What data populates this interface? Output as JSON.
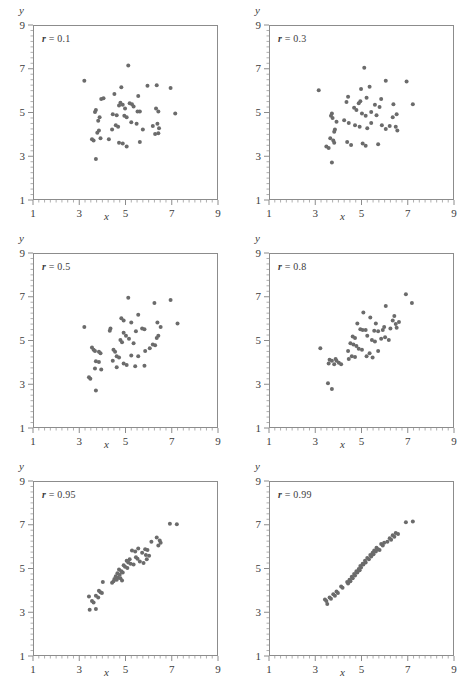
{
  "figure": {
    "type": "scatter-grid",
    "rows": 3,
    "cols": 2,
    "dot_color": "#6b6b6b",
    "frame_color": "#8c8c8c",
    "text_color": "#3c3c3c",
    "background": "#ffffff"
  },
  "axes_common": {
    "xlabel": "x",
    "ylabel": "y",
    "xlim": [
      1,
      9
    ],
    "ylim": [
      1,
      9
    ],
    "xticks": [
      1,
      3,
      5,
      7,
      9
    ],
    "yticks": [
      1,
      3,
      5,
      7,
      9
    ],
    "xtick_labels": [
      "1",
      "3",
      "5",
      "7",
      "9"
    ],
    "ytick_labels": [
      "1",
      "3",
      "5",
      "7",
      "9"
    ],
    "minor_ticks": true,
    "grid": false,
    "legend": "none"
  },
  "chart_data": [
    {
      "type": "scatter",
      "title": "",
      "annotation": "r = 0.1",
      "r_symbol": "r",
      "r_equals": " = ",
      "r_value": "0.1",
      "xlabel": "x",
      "ylabel": "y",
      "xlim": [
        1,
        9
      ],
      "ylim": [
        1,
        9
      ],
      "n": 52,
      "points": [
        [
          3.22,
          6.45
        ],
        [
          5.12,
          7.15
        ],
        [
          4.82,
          6.15
        ],
        [
          5.95,
          6.22
        ],
        [
          6.35,
          6.25
        ],
        [
          6.95,
          6.12
        ],
        [
          4.52,
          5.85
        ],
        [
          5.55,
          5.75
        ],
        [
          4.05,
          5.65
        ],
        [
          3.95,
          5.62
        ],
        [
          4.78,
          5.45
        ],
        [
          4.88,
          5.35
        ],
        [
          4.72,
          5.32
        ],
        [
          5.28,
          5.38
        ],
        [
          5.52,
          5.05
        ],
        [
          5.62,
          5.05
        ],
        [
          6.32,
          5.18
        ],
        [
          6.42,
          5.05
        ],
        [
          3.72,
          5.12
        ],
        [
          3.68,
          5.02
        ],
        [
          4.45,
          4.92
        ],
        [
          4.62,
          4.88
        ],
        [
          7.15,
          4.95
        ],
        [
          3.88,
          4.78
        ],
        [
          3.82,
          4.62
        ],
        [
          4.95,
          4.85
        ],
        [
          5.05,
          4.78
        ],
        [
          5.25,
          4.55
        ],
        [
          4.68,
          4.35
        ],
        [
          4.58,
          4.42
        ],
        [
          5.48,
          4.48
        ],
        [
          6.18,
          4.38
        ],
        [
          6.38,
          4.48
        ],
        [
          6.45,
          4.28
        ],
        [
          3.85,
          4.18
        ],
        [
          3.78,
          4.08
        ],
        [
          4.42,
          4.22
        ],
        [
          5.75,
          4.22
        ],
        [
          6.28,
          4.02
        ],
        [
          6.42,
          4.05
        ],
        [
          3.55,
          3.78
        ],
        [
          3.62,
          3.72
        ],
        [
          3.92,
          3.82
        ],
        [
          4.28,
          3.78
        ],
        [
          4.72,
          3.62
        ],
        [
          5.05,
          3.45
        ],
        [
          5.62,
          3.65
        ],
        [
          4.88,
          3.58
        ],
        [
          3.72,
          2.88
        ],
        [
          5.35,
          5.28
        ],
        [
          5.18,
          5.42
        ],
        [
          4.98,
          5.18
        ]
      ]
    },
    {
      "type": "scatter",
      "title": "",
      "annotation": "r = 0.3",
      "r_symbol": "r",
      "r_equals": " = ",
      "r_value": "0.3",
      "xlabel": "x",
      "ylabel": "y",
      "xlim": [
        1,
        9
      ],
      "ylim": [
        1,
        9
      ],
      "n": 52,
      "points": [
        [
          5.12,
          7.05
        ],
        [
          6.05,
          6.45
        ],
        [
          6.95,
          6.42
        ],
        [
          5.35,
          6.18
        ],
        [
          4.98,
          6.08
        ],
        [
          3.15,
          6.02
        ],
        [
          4.42,
          5.72
        ],
        [
          5.22,
          5.68
        ],
        [
          5.85,
          5.62
        ],
        [
          4.35,
          5.48
        ],
        [
          4.95,
          5.52
        ],
        [
          4.88,
          5.42
        ],
        [
          5.58,
          5.35
        ],
        [
          5.78,
          5.25
        ],
        [
          6.38,
          5.38
        ],
        [
          7.22,
          5.38
        ],
        [
          4.68,
          5.22
        ],
        [
          4.78,
          5.12
        ],
        [
          3.72,
          4.95
        ],
        [
          3.68,
          4.85
        ],
        [
          3.75,
          4.75
        ],
        [
          5.02,
          4.95
        ],
        [
          5.18,
          4.85
        ],
        [
          5.65,
          4.88
        ],
        [
          6.52,
          4.92
        ],
        [
          6.35,
          4.78
        ],
        [
          4.25,
          4.65
        ],
        [
          4.45,
          4.52
        ],
        [
          3.92,
          4.58
        ],
        [
          5.42,
          4.52
        ],
        [
          5.88,
          4.42
        ],
        [
          6.22,
          4.38
        ],
        [
          6.48,
          4.35
        ],
        [
          3.85,
          4.22
        ],
        [
          3.82,
          4.12
        ],
        [
          4.72,
          4.42
        ],
        [
          4.92,
          4.35
        ],
        [
          5.25,
          4.28
        ],
        [
          6.05,
          4.25
        ],
        [
          6.55,
          4.18
        ],
        [
          3.65,
          3.82
        ],
        [
          3.78,
          3.72
        ],
        [
          3.82,
          3.62
        ],
        [
          4.38,
          3.65
        ],
        [
          4.55,
          3.52
        ],
        [
          5.05,
          3.58
        ],
        [
          5.18,
          3.48
        ],
        [
          5.72,
          3.55
        ],
        [
          3.48,
          3.45
        ],
        [
          3.58,
          3.38
        ],
        [
          3.72,
          2.72
        ],
        [
          5.42,
          5.02
        ]
      ]
    },
    {
      "type": "scatter",
      "title": "",
      "annotation": "r = 0.5",
      "r_symbol": "r",
      "r_equals": " = ",
      "r_value": "0.5",
      "xlabel": "x",
      "ylabel": "y",
      "xlim": [
        1,
        9
      ],
      "ylim": [
        1,
        9
      ],
      "n": 52,
      "points": [
        [
          5.12,
          6.95
        ],
        [
          6.25,
          6.72
        ],
        [
          6.95,
          6.85
        ],
        [
          5.55,
          6.18
        ],
        [
          4.82,
          6.02
        ],
        [
          4.92,
          5.92
        ],
        [
          5.25,
          5.82
        ],
        [
          3.22,
          5.62
        ],
        [
          4.35,
          5.55
        ],
        [
          4.32,
          5.45
        ],
        [
          6.38,
          5.82
        ],
        [
          6.52,
          5.62
        ],
        [
          7.25,
          5.78
        ],
        [
          5.72,
          5.55
        ],
        [
          5.82,
          5.52
        ],
        [
          4.92,
          5.35
        ],
        [
          5.02,
          5.22
        ],
        [
          5.15,
          5.08
        ],
        [
          6.42,
          5.22
        ],
        [
          6.35,
          5.12
        ],
        [
          4.78,
          5.02
        ],
        [
          4.85,
          4.92
        ],
        [
          5.35,
          4.88
        ],
        [
          6.18,
          4.82
        ],
        [
          6.28,
          4.78
        ],
        [
          3.55,
          4.68
        ],
        [
          3.62,
          4.58
        ],
        [
          3.68,
          4.52
        ],
        [
          3.85,
          4.48
        ],
        [
          3.92,
          4.42
        ],
        [
          4.48,
          4.58
        ],
        [
          4.55,
          4.48
        ],
        [
          6.05,
          4.65
        ],
        [
          5.85,
          4.52
        ],
        [
          4.62,
          4.28
        ],
        [
          4.72,
          4.22
        ],
        [
          5.25,
          4.32
        ],
        [
          5.55,
          4.28
        ],
        [
          3.72,
          4.05
        ],
        [
          3.85,
          4.02
        ],
        [
          4.45,
          4.08
        ],
        [
          4.92,
          3.95
        ],
        [
          5.05,
          3.88
        ],
        [
          5.42,
          3.82
        ],
        [
          5.82,
          3.85
        ],
        [
          3.68,
          3.72
        ],
        [
          3.95,
          3.68
        ],
        [
          4.62,
          3.78
        ],
        [
          3.42,
          3.32
        ],
        [
          3.48,
          3.25
        ],
        [
          3.72,
          2.72
        ],
        [
          5.45,
          5.42
        ]
      ]
    },
    {
      "type": "scatter",
      "title": "",
      "annotation": "r = 0.8",
      "r_symbol": "r",
      "r_equals": " = ",
      "r_value": "0.8",
      "xlabel": "x",
      "ylabel": "y",
      "xlim": [
        1,
        9
      ],
      "ylim": [
        1,
        9
      ],
      "n": 52,
      "points": [
        [
          6.92,
          7.12
        ],
        [
          7.18,
          6.72
        ],
        [
          6.05,
          6.58
        ],
        [
          5.08,
          6.28
        ],
        [
          5.38,
          6.05
        ],
        [
          6.42,
          6.12
        ],
        [
          6.35,
          5.92
        ],
        [
          4.82,
          5.78
        ],
        [
          5.62,
          5.78
        ],
        [
          6.48,
          5.75
        ],
        [
          6.52,
          5.58
        ],
        [
          6.25,
          5.55
        ],
        [
          4.95,
          5.52
        ],
        [
          5.05,
          5.48
        ],
        [
          5.18,
          5.48
        ],
        [
          5.55,
          5.45
        ],
        [
          5.72,
          5.42
        ],
        [
          5.92,
          5.48
        ],
        [
          4.62,
          5.18
        ],
        [
          4.72,
          5.12
        ],
        [
          5.25,
          5.22
        ],
        [
          5.85,
          5.08
        ],
        [
          6.02,
          5.15
        ],
        [
          6.18,
          5.02
        ],
        [
          4.52,
          4.88
        ],
        [
          4.65,
          4.82
        ],
        [
          4.78,
          4.75
        ],
        [
          5.45,
          5.02
        ],
        [
          5.58,
          4.95
        ],
        [
          3.22,
          4.65
        ],
        [
          4.88,
          4.62
        ],
        [
          5.02,
          4.58
        ],
        [
          5.72,
          4.52
        ],
        [
          5.35,
          4.42
        ],
        [
          4.58,
          4.28
        ],
        [
          4.72,
          4.25
        ],
        [
          4.45,
          4.15
        ],
        [
          5.22,
          4.28
        ],
        [
          5.48,
          4.22
        ],
        [
          3.62,
          4.12
        ],
        [
          3.72,
          4.08
        ],
        [
          3.88,
          4.15
        ],
        [
          3.92,
          4.08
        ],
        [
          3.58,
          3.95
        ],
        [
          3.82,
          3.92
        ],
        [
          4.02,
          3.98
        ],
        [
          4.12,
          3.92
        ],
        [
          3.55,
          3.05
        ],
        [
          3.72,
          2.78
        ],
        [
          6.62,
          5.85
        ],
        [
          5.98,
          5.62
        ],
        [
          4.42,
          4.52
        ]
      ]
    },
    {
      "type": "scatter",
      "title": "",
      "annotation": "r = 0.95",
      "r_symbol": "r",
      "r_equals": " = ",
      "r_value": "0.95",
      "xlabel": "x",
      "ylabel": "y",
      "xlim": [
        1,
        9
      ],
      "ylim": [
        1,
        9
      ],
      "n": 52,
      "points": [
        [
          6.92,
          7.05
        ],
        [
          7.22,
          7.02
        ],
        [
          6.35,
          6.42
        ],
        [
          6.48,
          6.28
        ],
        [
          6.52,
          6.18
        ],
        [
          6.12,
          6.22
        ],
        [
          6.42,
          6.05
        ],
        [
          5.55,
          5.92
        ],
        [
          5.85,
          5.88
        ],
        [
          5.95,
          5.85
        ],
        [
          5.28,
          5.82
        ],
        [
          5.42,
          5.78
        ],
        [
          5.72,
          5.72
        ],
        [
          5.88,
          5.62
        ],
        [
          6.02,
          5.58
        ],
        [
          5.45,
          5.52
        ],
        [
          5.52,
          5.45
        ],
        [
          5.18,
          5.42
        ],
        [
          5.05,
          5.35
        ],
        [
          5.12,
          5.28
        ],
        [
          5.22,
          5.22
        ],
        [
          5.35,
          5.18
        ],
        [
          5.62,
          5.32
        ],
        [
          5.78,
          5.25
        ],
        [
          4.92,
          5.15
        ],
        [
          4.98,
          5.08
        ],
        [
          5.08,
          5.02
        ],
        [
          4.72,
          4.95
        ],
        [
          4.82,
          4.88
        ],
        [
          4.88,
          4.82
        ],
        [
          4.65,
          4.78
        ],
        [
          4.75,
          4.72
        ],
        [
          4.58,
          4.65
        ],
        [
          4.68,
          4.58
        ],
        [
          4.52,
          4.52
        ],
        [
          4.62,
          4.48
        ],
        [
          4.78,
          4.55
        ],
        [
          4.85,
          4.45
        ],
        [
          4.48,
          4.42
        ],
        [
          4.42,
          4.35
        ],
        [
          4.02,
          4.38
        ],
        [
          3.85,
          3.98
        ],
        [
          3.92,
          3.92
        ],
        [
          3.98,
          3.88
        ],
        [
          3.72,
          3.75
        ],
        [
          3.82,
          3.68
        ],
        [
          3.42,
          3.72
        ],
        [
          3.55,
          3.52
        ],
        [
          3.62,
          3.45
        ],
        [
          3.45,
          3.12
        ],
        [
          3.72,
          3.15
        ],
        [
          5.92,
          5.42
        ]
      ]
    },
    {
      "type": "scatter",
      "title": "",
      "annotation": "r = 0.99",
      "r_symbol": "r",
      "r_equals": " = ",
      "r_value": "0.99",
      "xlabel": "x",
      "ylabel": "y",
      "xlim": [
        1,
        9
      ],
      "ylim": [
        1,
        9
      ],
      "n": 52,
      "points": [
        [
          6.92,
          7.12
        ],
        [
          7.22,
          7.15
        ],
        [
          6.48,
          6.62
        ],
        [
          6.58,
          6.58
        ],
        [
          6.35,
          6.52
        ],
        [
          6.42,
          6.45
        ],
        [
          6.22,
          6.38
        ],
        [
          6.28,
          6.32
        ],
        [
          6.12,
          6.22
        ],
        [
          5.85,
          6.12
        ],
        [
          5.92,
          6.05
        ],
        [
          5.65,
          5.95
        ],
        [
          5.72,
          5.88
        ],
        [
          5.55,
          5.82
        ],
        [
          5.62,
          5.78
        ],
        [
          5.78,
          5.85
        ],
        [
          5.48,
          5.72
        ],
        [
          5.52,
          5.65
        ],
        [
          5.38,
          5.62
        ],
        [
          5.42,
          5.55
        ],
        [
          5.25,
          5.48
        ],
        [
          5.32,
          5.42
        ],
        [
          5.15,
          5.35
        ],
        [
          5.18,
          5.28
        ],
        [
          5.05,
          5.22
        ],
        [
          5.08,
          5.18
        ],
        [
          4.95,
          5.12
        ],
        [
          4.98,
          5.05
        ],
        [
          4.88,
          4.98
        ],
        [
          4.92,
          4.92
        ],
        [
          4.78,
          4.88
        ],
        [
          4.82,
          4.82
        ],
        [
          4.68,
          4.75
        ],
        [
          4.72,
          4.68
        ],
        [
          4.58,
          4.62
        ],
        [
          4.62,
          4.55
        ],
        [
          4.48,
          4.48
        ],
        [
          4.52,
          4.42
        ],
        [
          4.38,
          4.38
        ],
        [
          4.42,
          4.32
        ],
        [
          4.12,
          4.18
        ],
        [
          4.18,
          4.12
        ],
        [
          3.92,
          3.95
        ],
        [
          3.98,
          3.88
        ],
        [
          3.78,
          3.82
        ],
        [
          3.85,
          3.75
        ],
        [
          3.62,
          3.68
        ],
        [
          3.68,
          3.62
        ],
        [
          3.42,
          3.58
        ],
        [
          3.48,
          3.52
        ],
        [
          3.52,
          3.38
        ],
        [
          5.98,
          6.18
        ]
      ]
    }
  ]
}
